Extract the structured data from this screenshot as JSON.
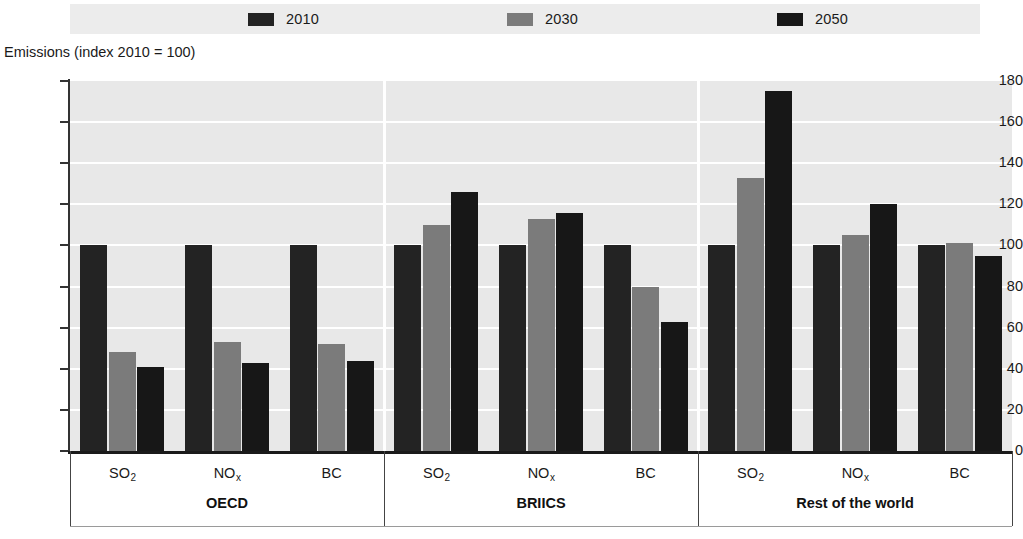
{
  "legend": {
    "items": [
      {
        "label": "2010",
        "color": "#232323",
        "swatch_name": "legend-swatch-2010"
      },
      {
        "label": "2030",
        "color": "#7b7b7b",
        "swatch_name": "legend-swatch-2030"
      },
      {
        "label": "2050",
        "color": "#171717",
        "swatch_name": "legend-swatch-2050"
      }
    ],
    "background": "#ececec"
  },
  "axis": {
    "y_title": "Emissions (index 2010 = 100)",
    "y_ticks": [
      "180",
      "160",
      "140",
      "120",
      "100",
      "80",
      "60",
      "40",
      "20",
      "0"
    ]
  },
  "groups": [
    {
      "name": "OECD",
      "categories": [
        {
          "label_main": "SO",
          "label_sub": "2"
        },
        {
          "label_main": "NO",
          "label_sub": "x"
        },
        {
          "label_main": "BC",
          "label_sub": ""
        }
      ]
    },
    {
      "name": "BRIICS",
      "categories": [
        {
          "label_main": "SO",
          "label_sub": "2"
        },
        {
          "label_main": "NO",
          "label_sub": "x"
        },
        {
          "label_main": "BC",
          "label_sub": ""
        }
      ]
    },
    {
      "name": "Rest of the world",
      "categories": [
        {
          "label_main": "SO",
          "label_sub": "2"
        },
        {
          "label_main": "NO",
          "label_sub": "x"
        },
        {
          "label_main": "BC",
          "label_sub": ""
        }
      ]
    }
  ],
  "chart_data": {
    "type": "bar",
    "title": "",
    "subtitle": "",
    "xlabel": "",
    "ylabel": "Emissions (index 2010 = 100)",
    "ylim": [
      0,
      180
    ],
    "ytick_step": 20,
    "grid": true,
    "legend_position": "top-center",
    "group_labels": [
      "OECD",
      "BRIICS",
      "Rest of the world"
    ],
    "categories": [
      "OECD SO2",
      "OECD NOx",
      "OECD BC",
      "BRIICS SO2",
      "BRIICS NOx",
      "BRIICS BC",
      "Rest of the world SO2",
      "Rest of the world NOx",
      "Rest of the world BC"
    ],
    "series": [
      {
        "name": "2010",
        "color": "#232323",
        "values": [
          100,
          100,
          100,
          100,
          100,
          100,
          100,
          100,
          100
        ]
      },
      {
        "name": "2030",
        "color": "#7b7b7b",
        "values": [
          48,
          53,
          52,
          110,
          113,
          80,
          133,
          105,
          101
        ]
      },
      {
        "name": "2050",
        "color": "#171717",
        "values": [
          41,
          43,
          44,
          126,
          116,
          63,
          175,
          120,
          95
        ]
      }
    ]
  }
}
